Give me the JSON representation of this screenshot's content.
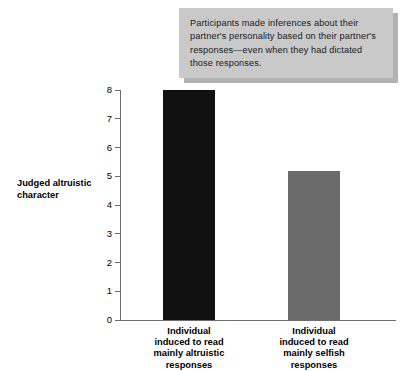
{
  "callout": {
    "text": "Participants made inferences about their partner's personality based on their partner's responses—even when they had dictated those responses.",
    "background_color": "#c9c9c9",
    "shadow_color": "#b2b2b2"
  },
  "chart_data": {
    "type": "bar",
    "title": "",
    "xlabel": "",
    "ylabel": "Judged altruistic\ncharacter",
    "categories": [
      "Individual\ninduced to read\nmainly altruistic\nresponses",
      "Individual\ninduced to read\nmainly selfish\nresponses"
    ],
    "values": [
      8.0,
      5.2
    ],
    "bar_colors": [
      "#111111",
      "#6b6b6b"
    ],
    "ylim": [
      0,
      8
    ],
    "yticks": [
      0,
      1,
      2,
      3,
      4,
      5,
      6,
      7,
      8
    ],
    "ytick_labels": [
      "0",
      "1",
      "2",
      "3",
      "4",
      "5",
      "6",
      "7",
      "8"
    ],
    "grid": false,
    "legend": "none",
    "axis_color": "#6e6e6e"
  }
}
